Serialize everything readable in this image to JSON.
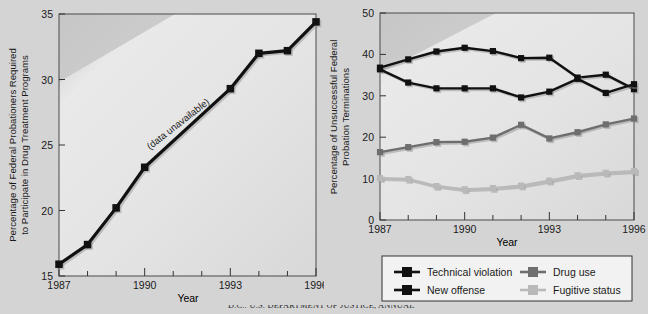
{
  "figure": {
    "background_color": "#d4d4d4",
    "plot_fill_light": "#e8e8e8",
    "plot_fill_dark": "#c9c9c9",
    "source_note": "D.C.: U.S. DEPARTMENT OF JUSTICE, ANNUAL"
  },
  "chart_data": [
    {
      "type": "line",
      "id": "left",
      "title": "",
      "xlabel": "Year",
      "ylabel": "Percentage of Federal Probationers Required to Participate in Drug Treatment Programs",
      "ylabel_line1": "Percentage of Federal Probationers Required",
      "ylabel_line2": "to Participate in Drug Treatment Programs",
      "xlim": [
        1987,
        1996
      ],
      "ylim": [
        15,
        35
      ],
      "yticks": [
        15,
        20,
        25,
        30,
        35
      ],
      "ytick_labels": [
        "15",
        "20",
        "25",
        "30",
        "35"
      ],
      "xticks": [
        1987,
        1988,
        1989,
        1990,
        1991,
        1992,
        1993,
        1994,
        1995,
        1996
      ],
      "xtick_labels": [
        "1987",
        "",
        "",
        "1990",
        "",
        "",
        "1993",
        "",
        "",
        "1996"
      ],
      "xtick_labels_major": [
        "1987",
        "1990",
        "1993",
        "1996"
      ],
      "grid": false,
      "annotation": "(data unavailable)",
      "series": [
        {
          "name": "Federal probationers required to participate in drug treatment programs",
          "color": "#111111",
          "marker": "square",
          "x": [
            1987,
            1988,
            1989,
            1990,
            1993,
            1994,
            1995,
            1996
          ],
          "values": [
            15.9,
            17.4,
            20.2,
            23.3,
            29.3,
            32.0,
            32.2,
            34.4
          ]
        }
      ]
    },
    {
      "type": "line",
      "id": "right",
      "title": "",
      "xlabel": "Year",
      "ylabel": "Percentage of Unsuccessful Federal Probation Terminations",
      "ylabel_line1": "Percentage of Unsuccessful Federal",
      "ylabel_line2": "Probation Terminations",
      "xlim": [
        1987,
        1996
      ],
      "ylim": [
        0,
        50
      ],
      "yticks": [
        0,
        10,
        20,
        30,
        40,
        50
      ],
      "ytick_labels": [
        "0",
        "10",
        "20",
        "30",
        "40",
        "50"
      ],
      "xticks": [
        1987,
        1988,
        1989,
        1990,
        1991,
        1992,
        1993,
        1994,
        1995,
        1996
      ],
      "xtick_labels_major": [
        "1987",
        "1990",
        "1993",
        "1996"
      ],
      "grid": false,
      "legend_position": "below",
      "x": [
        1987,
        1988,
        1989,
        1990,
        1991,
        1992,
        1993,
        1994,
        1995,
        1996
      ],
      "series": [
        {
          "name": "Technical violation",
          "color": "#111111",
          "marker": "square",
          "values": [
            36.8,
            38.8,
            40.7,
            41.6,
            40.8,
            39.1,
            39.2,
            34.4,
            35.1,
            31.6
          ]
        },
        {
          "name": "New offense",
          "color": "#111111",
          "marker": "square",
          "values": [
            36.4,
            33.2,
            31.8,
            31.8,
            31.8,
            29.6,
            31.0,
            34.1,
            30.7,
            32.8
          ]
        },
        {
          "name": "Drug use",
          "color": "#6e6e6e",
          "marker": "square",
          "values": [
            16.4,
            17.6,
            18.8,
            18.9,
            19.9,
            23.0,
            19.7,
            21.2,
            23.1,
            24.5
          ]
        },
        {
          "name": "Fugitive status",
          "color": "#b9b9b9",
          "marker": "square",
          "values": [
            10.1,
            9.9,
            8.2,
            7.4,
            7.7,
            8.3,
            9.5,
            10.8,
            11.4,
            11.8
          ]
        }
      ]
    }
  ],
  "legend": {
    "items": [
      {
        "label": "Technical violation",
        "color": "#111111"
      },
      {
        "label": "New offense",
        "color": "#111111"
      },
      {
        "label": "Drug use",
        "color": "#6e6e6e"
      },
      {
        "label": "Fugitive status",
        "color": "#b9b9b9"
      }
    ]
  }
}
